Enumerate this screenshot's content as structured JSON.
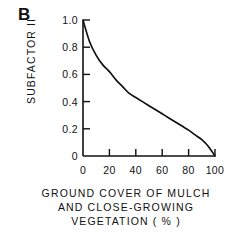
{
  "panel": {
    "label": "B"
  },
  "chart_data": {
    "type": "line",
    "title": "",
    "panel_label": "B",
    "xlabel": "GROUND COVER OF MULCH AND CLOSE-GROWING VEGETATION ( % )",
    "ylabel": "SUBFACTOR II",
    "xlim": [
      0,
      100
    ],
    "ylim": [
      0,
      1.0
    ],
    "grid": false,
    "legend": null,
    "xticks": [
      0,
      20,
      40,
      60,
      80,
      100
    ],
    "xtick_labels": [
      "0",
      "20",
      "40",
      "60",
      "80",
      "100"
    ],
    "yticks": [
      0,
      0.2,
      0.4,
      0.6,
      0.8,
      1.0
    ],
    "ytick_labels": [
      "0",
      "0.2",
      "0.4",
      "0.6",
      "0.8",
      "1.0"
    ],
    "tick_direction": "in",
    "line_color": "#111111",
    "x": [
      0,
      5,
      10,
      15,
      20,
      25,
      30,
      35,
      40,
      45,
      50,
      55,
      60,
      65,
      70,
      75,
      80,
      85,
      90,
      95,
      100
    ],
    "y": [
      1.0,
      0.84,
      0.74,
      0.67,
      0.62,
      0.56,
      0.51,
      0.46,
      0.43,
      0.4,
      0.37,
      0.34,
      0.31,
      0.28,
      0.25,
      0.22,
      0.19,
      0.155,
      0.12,
      0.07,
      0.0
    ],
    "series": [
      {
        "name": "Subfactor II",
        "x": [
          0,
          5,
          10,
          15,
          20,
          25,
          30,
          35,
          40,
          45,
          50,
          55,
          60,
          65,
          70,
          75,
          80,
          85,
          90,
          95,
          100
        ],
        "values": [
          1.0,
          0.84,
          0.74,
          0.67,
          0.62,
          0.56,
          0.51,
          0.46,
          0.43,
          0.4,
          0.37,
          0.34,
          0.31,
          0.28,
          0.25,
          0.22,
          0.19,
          0.155,
          0.12,
          0.07,
          0.0
        ]
      }
    ]
  },
  "caption": {
    "line1": "GROUND COVER OF MULCH",
    "line2": "AND CLOSE-GROWING",
    "line3": "VEGETATION ( % )"
  }
}
